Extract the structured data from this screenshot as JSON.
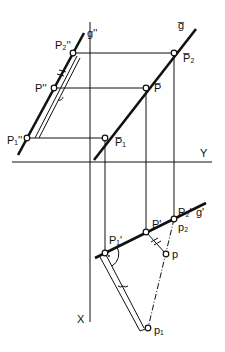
{
  "diagram": {
    "type": "descriptive-geometry-projection",
    "labels": {
      "g_double_prime": "g''",
      "g_bar": "g̅",
      "g_prime": "g'",
      "P2_double_prime": "P₂''",
      "P_double_prime": "P''",
      "P1_double_prime": "P₁''",
      "P2_bar": "P̅₂",
      "P_bar": "P̅",
      "P1_bar": "P̅₁",
      "P1_prime": "P₁'",
      "P_prime": "P'",
      "P2_prime": "P₂'",
      "p": "p",
      "p1": "p₁",
      "p2": "p₂",
      "axis_y": "Y",
      "axis_x": "X"
    },
    "colors": {
      "stroke": "#111111",
      "background": "#ffffff"
    }
  }
}
